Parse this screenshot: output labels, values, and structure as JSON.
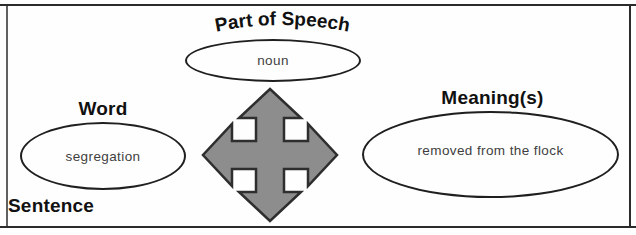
{
  "organizer": {
    "part_of_speech": {
      "label": "Part of Speech",
      "value": "noun"
    },
    "word": {
      "label": "Word",
      "value": "segregation"
    },
    "meanings": {
      "label": "Meaning(s)",
      "value": "removed from the flock"
    },
    "sentence": {
      "label": "Sentence"
    }
  },
  "icons": {
    "center_arrow": "four-way-move-arrow"
  },
  "colors": {
    "arrow_fill": "#8d8d8d",
    "arrow_stroke": "#2e2e2e",
    "frame_line": "#2b2b2b",
    "ellipse_line": "#1f1f1f",
    "label_text": "#111111",
    "value_text": "#3f3f3f",
    "background": "#fefefe"
  }
}
